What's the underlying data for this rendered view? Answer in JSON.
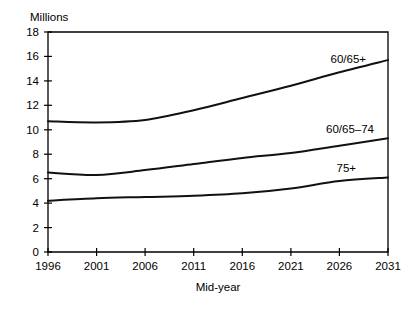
{
  "chart_data": {
    "type": "line",
    "title": "",
    "ylabel": "Millions",
    "xlabel": "Mid-year",
    "ylim": [
      0,
      18
    ],
    "ytick_step": 2,
    "yticks": [
      "0",
      "2",
      "4",
      "6",
      "8",
      "10",
      "12",
      "14",
      "16",
      "18"
    ],
    "categories": [
      "1996",
      "2001",
      "2006",
      "2011",
      "2016",
      "2021",
      "2026",
      "2031"
    ],
    "x": [
      1996,
      2001,
      2006,
      2011,
      2016,
      2021,
      2026,
      2031
    ],
    "grid": false,
    "legend_position": "inline-right",
    "series": [
      {
        "name": "60/65+",
        "label": "60/65+",
        "values": [
          10.7,
          10.6,
          10.8,
          11.6,
          12.6,
          13.6,
          14.7,
          15.7
        ]
      },
      {
        "name": "60/65-74",
        "label": "60/65–74",
        "values": [
          6.5,
          6.3,
          6.7,
          7.2,
          7.7,
          8.1,
          8.7,
          9.3
        ]
      },
      {
        "name": "75+",
        "label": "75+",
        "values": [
          4.2,
          4.4,
          4.5,
          4.6,
          4.8,
          5.2,
          5.8,
          6.1
        ]
      }
    ]
  },
  "labels": {
    "series_60_65_plus": "60/65+",
    "series_60_65_74": "60/65–74",
    "series_75_plus": "75+",
    "y_axis_title": "Millions",
    "x_axis_title": "Mid-year"
  },
  "yticks": {
    "t0": "0",
    "t1": "2",
    "t2": "4",
    "t3": "6",
    "t4": "8",
    "t5": "10",
    "t6": "12",
    "t7": "14",
    "t8": "16",
    "t9": "18"
  },
  "xticks": {
    "t0": "1996",
    "t1": "2001",
    "t2": "2006",
    "t3": "2011",
    "t4": "2016",
    "t5": "2021",
    "t6": "2026",
    "t7": "2031"
  },
  "colors": {
    "line": "#111111",
    "axis": "#000000",
    "background": "#ffffff"
  }
}
